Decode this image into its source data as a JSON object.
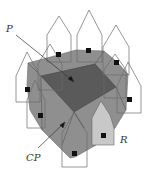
{
  "diagram": {
    "labels": {
      "p": "P",
      "cp": "CP",
      "r": "R"
    },
    "colors": {
      "background": "#ffffff",
      "outer_region": "#8f8f8f",
      "region_p": "#5a5a5a",
      "region_r": "#c8c8c8",
      "outline": "#6a6a6a",
      "marker": "#111111"
    },
    "elements": {
      "outline_pentagons": 9,
      "markers": 10
    }
  }
}
